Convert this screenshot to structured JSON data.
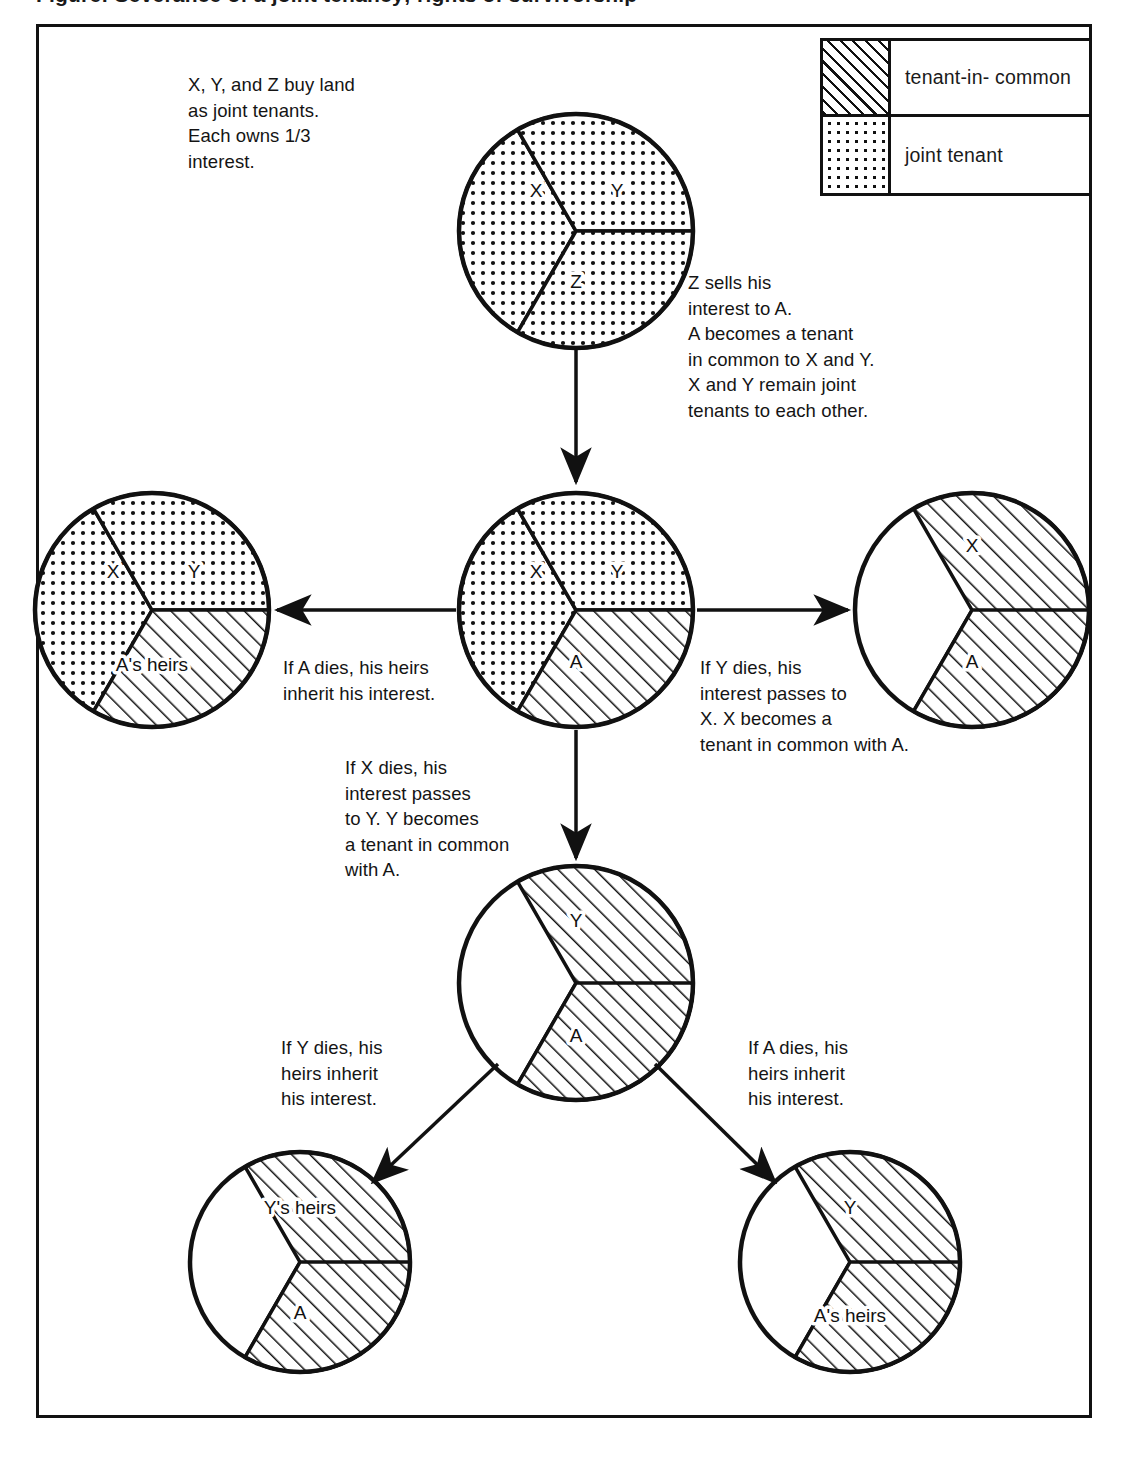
{
  "caption": "Figure: Severance of a joint tenancy; rights of survivorship",
  "legend": {
    "items": [
      {
        "pattern": "hatch",
        "label": "tenant-in- common"
      },
      {
        "pattern": "dots",
        "label": "joint tenant"
      }
    ]
  },
  "notes": {
    "intro": "X, Y, and Z buy land\nas joint tenants.\nEach owns 1/3\ninterest.",
    "z_sells": "Z sells his\ninterest to A.\nA becomes a tenant\nin common to X and Y.\nX and Y remain joint\ntenants to each other.",
    "a_dies_left": "If A dies, his heirs\ninherit his interest.",
    "y_dies_right": "If Y dies, his\ninterest passes to\nX. X becomes a\ntenant in common with A.",
    "x_dies_down": "If X dies, his\ninterest passes\nto Y. Y becomes\na tenant in common\nwith A.",
    "y_dies_bottom_left": "If Y dies, his\nheirs inherit\nhis interest.",
    "a_dies_bottom_right": "If A dies, his\nheirs inherit\nhis interest."
  },
  "chart_data": {
    "type": "pie",
    "legend": [
      "tenant-in- common",
      "joint tenant"
    ],
    "patterns": {
      "hatch": "tenant-in- common",
      "dots": "joint tenant"
    },
    "charts": [
      {
        "id": "pie-top",
        "name": "original-joint-tenancy",
        "cx": 576,
        "cy": 231,
        "r": 117,
        "slices": [
          {
            "label": "X",
            "value": 33.33,
            "start_deg": 210,
            "end_deg": 330,
            "pattern": "dots",
            "label_x": 536,
            "label_y": 197
          },
          {
            "label": "Y",
            "value": 33.33,
            "start_deg": 330,
            "end_deg": 90,
            "pattern": "dots",
            "label_x": 617,
            "label_y": 197
          },
          {
            "label": "Z",
            "value": 33.33,
            "start_deg": 90,
            "end_deg": 210,
            "pattern": "dots",
            "label_x": 576,
            "label_y": 288
          }
        ]
      },
      {
        "id": "pie-center",
        "name": "after-z-sells-to-a",
        "cx": 576,
        "cy": 610,
        "r": 117,
        "slices": [
          {
            "label": "X",
            "value": 33.33,
            "start_deg": 210,
            "end_deg": 330,
            "pattern": "dots",
            "label_x": 536,
            "label_y": 578
          },
          {
            "label": "Y",
            "value": 33.33,
            "start_deg": 330,
            "end_deg": 90,
            "pattern": "dots",
            "label_x": 617,
            "label_y": 578
          },
          {
            "label": "A",
            "value": 33.33,
            "start_deg": 90,
            "end_deg": 210,
            "pattern": "hatch",
            "label_x": 576,
            "label_y": 668
          }
        ]
      },
      {
        "id": "pie-left",
        "name": "a-dies-heirs-inherit",
        "cx": 152,
        "cy": 610,
        "r": 117,
        "slices": [
          {
            "label": "X",
            "value": 33.33,
            "start_deg": 210,
            "end_deg": 330,
            "pattern": "dots",
            "label_x": 113,
            "label_y": 578
          },
          {
            "label": "Y",
            "value": 33.33,
            "start_deg": 330,
            "end_deg": 90,
            "pattern": "dots",
            "label_x": 194,
            "label_y": 578
          },
          {
            "label": "A's heirs",
            "value": 33.33,
            "start_deg": 90,
            "end_deg": 210,
            "pattern": "hatch",
            "label_x": 152,
            "label_y": 671
          }
        ]
      },
      {
        "id": "pie-right",
        "name": "y-dies-interest-to-x",
        "cx": 972,
        "cy": 610,
        "r": 117,
        "slices": [
          {
            "label": "X",
            "value": 66.67,
            "start_deg": 330,
            "end_deg": 210,
            "pattern": "hatch",
            "label_x": 972,
            "label_y": 552
          },
          {
            "label": "A",
            "value": 33.33,
            "start_deg": 90,
            "end_deg": 210,
            "pattern": "hatch",
            "label_x": 972,
            "label_y": 668
          }
        ]
      },
      {
        "id": "pie-lower-center",
        "name": "x-dies-interest-to-y",
        "cx": 576,
        "cy": 983,
        "r": 117,
        "slices": [
          {
            "label": "Y",
            "value": 66.67,
            "start_deg": 330,
            "end_deg": 210,
            "pattern": "hatch",
            "label_x": 576,
            "label_y": 927
          },
          {
            "label": "A",
            "value": 33.33,
            "start_deg": 90,
            "end_deg": 210,
            "pattern": "hatch",
            "label_x": 576,
            "label_y": 1042
          }
        ]
      },
      {
        "id": "pie-bottom-left",
        "name": "y-dies-heirs-inherit",
        "cx": 300,
        "cy": 1262,
        "r": 110,
        "slices": [
          {
            "label": "Y's heirs",
            "value": 66.67,
            "start_deg": 330,
            "end_deg": 210,
            "pattern": "hatch",
            "label_x": 300,
            "label_y": 1214
          },
          {
            "label": "A",
            "value": 33.33,
            "start_deg": 90,
            "end_deg": 210,
            "pattern": "hatch",
            "label_x": 300,
            "label_y": 1319
          }
        ]
      },
      {
        "id": "pie-bottom-right",
        "name": "a-dies-heirs-inherit-2",
        "cx": 850,
        "cy": 1262,
        "r": 110,
        "slices": [
          {
            "label": "Y",
            "value": 66.67,
            "start_deg": 330,
            "end_deg": 210,
            "pattern": "hatch",
            "label_x": 850,
            "label_y": 1214
          },
          {
            "label": "A's heirs",
            "value": 33.33,
            "start_deg": 90,
            "end_deg": 210,
            "pattern": "hatch",
            "label_x": 850,
            "label_y": 1322
          }
        ]
      }
    ],
    "arrows": [
      {
        "name": "arrow-top-to-center",
        "x1": 576,
        "y1": 350,
        "x2": 576,
        "y2": 482
      },
      {
        "name": "arrow-center-to-left",
        "x1": 456,
        "y1": 610,
        "x2": 277,
        "y2": 610
      },
      {
        "name": "arrow-center-to-right",
        "x1": 697,
        "y1": 610,
        "x2": 848,
        "y2": 610
      },
      {
        "name": "arrow-center-to-lower",
        "x1": 576,
        "y1": 730,
        "x2": 576,
        "y2": 858
      },
      {
        "name": "arrow-lower-to-bottom-left",
        "x1": 498,
        "y1": 1064,
        "x2": 373,
        "y2": 1182
      },
      {
        "name": "arrow-lower-to-bottom-right",
        "x1": 655,
        "y1": 1064,
        "x2": 775,
        "y2": 1182
      }
    ]
  }
}
